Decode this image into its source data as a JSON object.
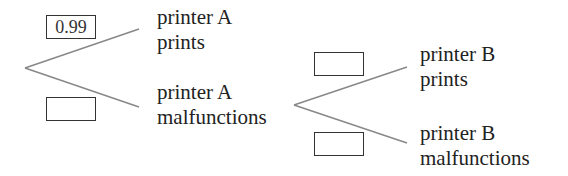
{
  "tree": {
    "stage_a": {
      "branches": [
        {
          "line1": "printer A",
          "line2": "prints",
          "probability": "0.99"
        },
        {
          "line1": "printer A",
          "line2": "malfunctions",
          "probability": ""
        }
      ]
    },
    "stage_b": {
      "parent": "printer A malfunctions",
      "branches": [
        {
          "line1": "printer B",
          "line2": "prints",
          "probability": ""
        },
        {
          "line1": "printer B",
          "line2": "malfunctions",
          "probability": ""
        }
      ]
    }
  },
  "colors": {
    "line": "#888888",
    "box_border": "#333333",
    "text": "#222222"
  }
}
